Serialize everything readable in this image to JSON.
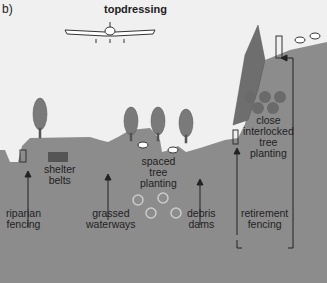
{
  "panel_label": "b)",
  "title": "topdressing",
  "labels": {
    "shelter_belts": "shelter\nbelts",
    "spaced_tree_planting": "spaced\ntree\nplanting",
    "close_interlocked": "close\ninterlocked\ntree\nplanting",
    "riparian_fencing": "riparian\nfencing",
    "grassed_waterways": "grassed\nwaterways",
    "debris_dams": "debris\ndams",
    "retirement_fencing": "retirement\nfencing"
  },
  "colors": {
    "ground": "#8c8c8c",
    "tree": "#7a7a7a",
    "background": "#f0f0f0",
    "dark_circle": "#6a6a6a"
  }
}
